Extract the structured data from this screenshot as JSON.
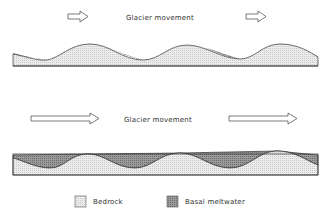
{
  "diagram_top": {
    "label": "Glacier movement",
    "arrows": [
      "right-arrow-short",
      "right-arrow-short"
    ]
  },
  "diagram_bottom": {
    "label": "Glacier movement",
    "arrows": [
      "right-arrow-long",
      "right-arrow-long"
    ]
  },
  "legend": {
    "items": [
      {
        "label": "Bedrock",
        "pattern": "light-stipple",
        "color": "#e4e4e4"
      },
      {
        "label": "Basal meltwater",
        "pattern": "dark-stipple",
        "color": "#8a8a8a"
      }
    ]
  },
  "colors": {
    "bedrock": "#e6e6e6",
    "meltwater": "#8c8c8c",
    "outline": "#333333"
  }
}
